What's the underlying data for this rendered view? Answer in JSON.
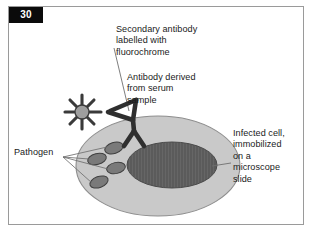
{
  "figure": {
    "number": "30",
    "domain": "biology-diagram",
    "title_hidden": "Immunofluorescence detection of an infected cell"
  },
  "labels": {
    "secondary_antibody": "Secondary antibody\nlabelled with\nfluorochrome",
    "antibody_serum": "Antibody derived\nfrom serum\nsample",
    "infected_cell": "Infected cell,\nimmobilized\non a\nmicroscope\nslide",
    "pathogen": "Pathogen"
  },
  "colors": {
    "frame_border": "#9a9a9a",
    "page_tab_bg": "#0b0b0b",
    "page_tab_text": "#ffffff",
    "text": "#1a1a1a",
    "cell_fill": "#c9c9c9",
    "cell_stroke": "#8d8d8d",
    "nucleus_fill": "#5b5b5b",
    "nucleus_stroke": "#4a4a4a",
    "pathogen_fill": "#7a7a7a",
    "pathogen_stroke": "#3f3f3f",
    "antibody_stroke": "#2f2f2f",
    "fluorochrome_stroke": "#3a3a3a",
    "fluorochrome_fill": "#9e9e9e",
    "leader_line": "#6f6f6f",
    "page_bg": "#ffffff"
  },
  "shapes": {
    "cell": {
      "name": "infected-cell",
      "cx": 158,
      "cy": 166,
      "rx": 82,
      "ry": 50
    },
    "nucleus": {
      "name": "cell-nucleus",
      "cx": 172,
      "cy": 165,
      "rx": 45,
      "ry": 23
    },
    "pathogens": [
      {
        "cx": 114,
        "cy": 148,
        "rx": 9.5,
        "ry": 5.5,
        "rot": -18
      },
      {
        "cx": 97,
        "cy": 159,
        "rx": 9.5,
        "ry": 5.5,
        "rot": -14
      },
      {
        "cx": 116,
        "cy": 168,
        "rx": 9.5,
        "ry": 5.5,
        "rot": -12
      },
      {
        "cx": 99,
        "cy": 182,
        "rx": 9.5,
        "ry": 5.5,
        "rot": -20
      }
    ],
    "fluorochrome_star": {
      "name": "fluorochrome-star",
      "cx": 82,
      "cy": 112,
      "core_r": 7,
      "spikes": 8,
      "spike_len": 15
    },
    "antibody": {
      "name": "antibody-y-shape",
      "hinge_x": 133,
      "hinge_y": 120
    }
  },
  "leader_lines": {
    "secondary_antibody_to_fluorochrome": {
      "x1": 114,
      "y1": 48,
      "x2": 129,
      "y2": 111
    },
    "infected_cell_to_membrane": {
      "x1": 231,
      "y1": 163,
      "x2": 213,
      "y2": 166
    },
    "pathogen_to_targets": [
      {
        "x1": 63,
        "y1": 157,
        "x2": 107,
        "y2": 148
      },
      {
        "x1": 63,
        "y1": 157,
        "x2": 89,
        "y2": 159
      },
      {
        "x1": 63,
        "y1": 157,
        "x2": 108,
        "y2": 169
      },
      {
        "x1": 63,
        "y1": 157,
        "x2": 92,
        "y2": 183
      }
    ]
  }
}
